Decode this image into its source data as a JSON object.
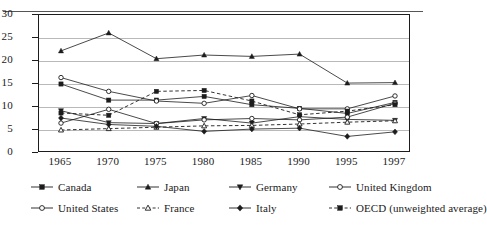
{
  "chart_data": {
    "type": "line",
    "title": "",
    "subtitle": "",
    "xlabel": "",
    "ylabel": "",
    "x": [
      "1965",
      "1970",
      "1975",
      "1980",
      "1985",
      "1990",
      "1995",
      "1997"
    ],
    "xtick_labels": [
      "1965",
      "1970",
      "1975",
      "1980",
      "1985",
      "1990",
      "1995",
      "1997"
    ],
    "ytick_labels": [
      "0",
      "5",
      "10",
      "15",
      "20",
      "25",
      "30"
    ],
    "ylim": [
      0,
      30
    ],
    "ytick_step": 5,
    "grid": "horizontal",
    "legend_position": "bottom",
    "series": [
      {
        "name": "Canada",
        "marker": "filled-square",
        "line_style": "solid",
        "values": [
          15.0,
          11.5,
          11.5,
          12.3,
          10.5,
          9.7,
          8.6,
          11.0
        ]
      },
      {
        "name": "Japan",
        "marker": "filled-triangle",
        "line_style": "solid",
        "values": [
          22.2,
          26.1,
          20.5,
          21.3,
          21.0,
          21.5,
          15.2,
          15.3
        ]
      },
      {
        "name": "Germany",
        "marker": "filled-down-triangle",
        "line_style": "solid",
        "values": [
          9.2,
          6.6,
          6.4,
          7.5,
          6.5,
          7.9,
          7.3,
          7.1
        ]
      },
      {
        "name": "United Kingdom",
        "marker": "open-circle",
        "line_style": "solid",
        "values": [
          16.4,
          13.4,
          11.3,
          10.8,
          12.5,
          9.6,
          9.6,
          12.4
        ]
      },
      {
        "name": "United States",
        "marker": "open-circle",
        "line_style": "solid",
        "values": [
          6.5,
          9.5,
          6.4,
          7.2,
          7.5,
          7.2,
          7.8,
          10.8
        ]
      },
      {
        "name": "France",
        "marker": "open-triangle",
        "line_style": "dashed",
        "values": [
          5.0,
          5.3,
          5.6,
          5.9,
          6.0,
          6.3,
          6.7,
          7.0
        ]
      },
      {
        "name": "Italy",
        "marker": "filled-diamond",
        "line_style": "solid",
        "values": [
          7.6,
          6.2,
          5.8,
          4.7,
          5.2,
          5.4,
          3.6,
          4.6
        ]
      },
      {
        "name": "OECD (unweighted average)",
        "marker": "filled-square",
        "line_style": "dashed",
        "values": [
          8.7,
          8.2,
          13.4,
          13.6,
          11.3,
          8.3,
          9.1,
          10.5
        ]
      }
    ]
  },
  "legend": {
    "items": [
      {
        "label": "Canada"
      },
      {
        "label": "Japan"
      },
      {
        "label": "Germany"
      },
      {
        "label": "United Kingdom"
      },
      {
        "label": "United States"
      },
      {
        "label": "France"
      },
      {
        "label": "Italy"
      },
      {
        "label": "OECD (unweighted average)"
      }
    ]
  }
}
